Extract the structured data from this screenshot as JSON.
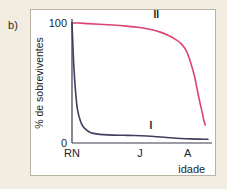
{
  "figure": {
    "panel_letter": "b)",
    "background_color": "#f2ece1",
    "panel_background": "#ffffff",
    "panel_border_color": "#b9b3a6"
  },
  "chart_data": {
    "type": "line",
    "title": "",
    "subtitle": "",
    "xlabel": "idade",
    "ylabel": "% de sobreviventes",
    "ylim": [
      0,
      100
    ],
    "ytick_labels": [
      "0",
      "100"
    ],
    "ytick_values": [
      0,
      100
    ],
    "xtick_labels": [
      "RN",
      "J",
      "A"
    ],
    "xtick_values": [
      0,
      50,
      85
    ],
    "xlim": [
      0,
      100
    ],
    "grid": false,
    "legend_position": "inline-annotations",
    "annotations": [
      {
        "text": "II",
        "x": 62,
        "y": 104,
        "color": "#1d1d1d"
      },
      {
        "text": "I",
        "x": 58,
        "y": 12,
        "color": "#1d1d1d"
      }
    ],
    "series": [
      {
        "name": "I",
        "label": "I",
        "color": "#3f3f5e",
        "stroke_width": 1.6,
        "description": "Type III survivorship curve - steep early mortality",
        "x": [
          0,
          1,
          2,
          3,
          4,
          6,
          8,
          11,
          14,
          18,
          23,
          30,
          38,
          46,
          55,
          63,
          72,
          80,
          88,
          94,
          100
        ],
        "values": [
          100,
          72,
          52,
          38,
          28,
          19,
          14,
          10.5,
          8.6,
          7.6,
          7.0,
          6.6,
          6.4,
          6.2,
          5.8,
          5.2,
          4.4,
          3.8,
          3.4,
          3.2,
          3.1
        ]
      },
      {
        "name": "II",
        "label": "II",
        "color": "#d9456e",
        "stroke_width": 1.6,
        "description": "Type I survivorship curve - high survival then sharp late decline",
        "x": [
          0,
          5,
          12,
          20,
          30,
          40,
          50,
          58,
          65,
          71,
          76,
          80,
          84,
          87,
          90,
          92,
          94,
          96,
          97,
          98
        ],
        "values": [
          100,
          100,
          99.5,
          99,
          98.3,
          97.4,
          96.2,
          94.6,
          92.4,
          89.6,
          86.4,
          83.0,
          77.0,
          68.0,
          56.0,
          45.0,
          34.0,
          24.0,
          18.5,
          15.0
        ]
      }
    ]
  }
}
